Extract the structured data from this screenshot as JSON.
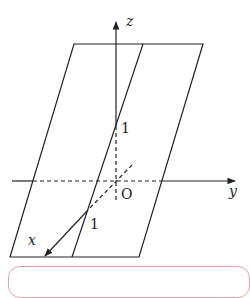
{
  "figure": {
    "axes": {
      "x_label": "x",
      "y_label": "y",
      "z_label": "z",
      "origin_label": "O"
    },
    "ticks": {
      "z_tick": "1",
      "x_tick": "1"
    },
    "colors": {
      "line": "#222222",
      "callout_border": "#e8a0a8"
    }
  }
}
